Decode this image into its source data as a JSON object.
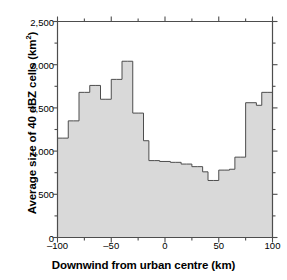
{
  "chart_data": {
    "type": "bar",
    "title": "",
    "subtitle": "",
    "xlabel": "Downwind from urban centre (km)",
    "ylabel": "Average size of 40 dBZ cells (km²)",
    "ylabel_main": "Average size of 40 dBZ cells (km",
    "ylabel_sup": "2",
    "ylabel_tail": ")",
    "xlim": [
      -100,
      100
    ],
    "ylim": [
      0,
      2500
    ],
    "grid": false,
    "legend": null,
    "bin_width": 5,
    "series_name": "Average size of 40 dBZ cells",
    "fill_color": "#d9d9d9",
    "edge_color": "#4d4d4d",
    "axis_color": "#4d4d4d",
    "xticks": [
      -100,
      -50,
      0,
      50,
      100
    ],
    "xticklabels": [
      "–100",
      "–50",
      "0",
      "50",
      "100"
    ],
    "xminorticks": [
      -75,
      -25,
      25,
      75
    ],
    "yticks": [
      0,
      500,
      1000,
      1500,
      2000,
      2500
    ],
    "yticklabels": [
      "0",
      "500",
      "1,000",
      "1,500",
      "2,000",
      "2,500"
    ],
    "yminorticks": [
      250,
      750,
      1250,
      1750,
      2250
    ],
    "bin_edges": [
      -100,
      -95,
      -90,
      -85,
      -80,
      -75,
      -70,
      -65,
      -60,
      -55,
      -50,
      -45,
      -40,
      -35,
      -30,
      -25,
      -20,
      -15,
      -10,
      -5,
      0,
      5,
      10,
      15,
      20,
      25,
      30,
      35,
      40,
      45,
      50,
      55,
      60,
      65,
      70,
      75,
      80,
      85,
      90,
      95,
      100
    ],
    "bin_centers": [
      -97.5,
      -92.5,
      -87.5,
      -82.5,
      -77.5,
      -72.5,
      -67.5,
      -62.5,
      -57.5,
      -52.5,
      -47.5,
      -42.5,
      -37.5,
      -32.5,
      -27.5,
      -22.5,
      -17.5,
      -12.5,
      -7.5,
      -2.5,
      2.5,
      7.5,
      12.5,
      17.5,
      22.5,
      27.5,
      32.5,
      37.5,
      42.5,
      47.5,
      52.5,
      57.5,
      62.5,
      67.5,
      72.5,
      77.5,
      82.5,
      87.5,
      92.5,
      97.5
    ],
    "values": [
      1150,
      1150,
      1350,
      1350,
      1680,
      1680,
      1760,
      1760,
      1600,
      1600,
      1830,
      1830,
      2040,
      2040,
      1440,
      1440,
      1120,
      890,
      890,
      880,
      880,
      870,
      870,
      850,
      850,
      820,
      820,
      760,
      660,
      660,
      780,
      780,
      790,
      930,
      930,
      1560,
      1560,
      1530,
      1680,
      1680
    ]
  }
}
